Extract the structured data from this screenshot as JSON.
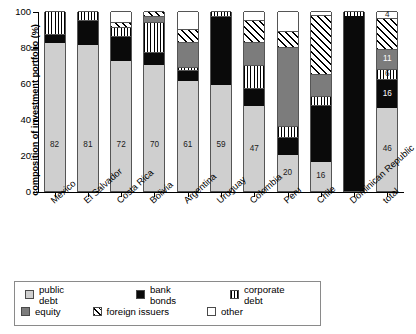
{
  "chart_data": {
    "type": "bar",
    "title": "",
    "subtitle": "",
    "stacked": true,
    "xlabel": "",
    "ylabel": "composition of investment portfolio (%)",
    "ylim": [
      0,
      100
    ],
    "yticks": [
      0,
      20,
      40,
      60,
      80,
      100
    ],
    "ytick_labels": [
      "0",
      "20",
      "40",
      "60",
      "80",
      "100"
    ],
    "grid": false,
    "legend_position": "bottom",
    "categories": [
      "Mexico",
      "El Salvador",
      "Costa Rica",
      "Bolivia",
      "Argentina",
      "Uruguay",
      "Colombia",
      "Peru",
      "Chile",
      "Dominican Republic",
      "total"
    ],
    "series": [
      {
        "name": "public debt",
        "color": "#cfcfcf",
        "pattern": "solid",
        "values": [
          82,
          81,
          72,
          70,
          61,
          59,
          47,
          20,
          16,
          0,
          46
        ]
      },
      {
        "name": "bank bonds",
        "color": "#0a0a0a",
        "pattern": "solid",
        "values": [
          5,
          14,
          14,
          7,
          6,
          38,
          10,
          10,
          32,
          97,
          16
        ]
      },
      {
        "name": "corporate debt",
        "color": "#ffffff",
        "pattern": "vertical-stripes",
        "values": [
          13,
          5,
          5,
          17,
          2,
          3,
          13,
          6,
          5,
          3,
          6
        ]
      },
      {
        "name": "equity",
        "color": "#7c7c7c",
        "pattern": "solid",
        "values": [
          0,
          0,
          0,
          3,
          14,
          0,
          13,
          44,
          12,
          0,
          11
        ]
      },
      {
        "name": "foreign issuers",
        "color": "#ffffff",
        "pattern": "diagonal-hatch",
        "values": [
          0,
          0,
          3,
          3,
          7,
          0,
          12,
          9,
          33,
          0,
          17
        ]
      },
      {
        "name": "other",
        "color": "#ffffff",
        "pattern": "solid",
        "values": [
          0,
          0,
          6,
          0,
          10,
          0,
          5,
          11,
          2,
          0,
          4
        ]
      }
    ],
    "data_labels": {
      "public debt": [
        "82",
        "81",
        "72",
        "70",
        "61",
        "59",
        "47",
        "20",
        "16",
        "",
        "46"
      ],
      "bank bonds": [
        "",
        "",
        "",
        "",
        "",
        "",
        "",
        "",
        "",
        "",
        "16"
      ],
      "corporate debt": [
        "",
        "",
        "",
        "",
        "",
        "",
        "",
        "",
        "",
        "",
        "6"
      ],
      "equity": [
        "",
        "",
        "",
        "",
        "",
        "",
        "",
        "",
        "",
        "",
        "11"
      ],
      "foreign issuers": [
        "",
        "",
        "",
        "",
        "",
        "",
        "",
        "",
        "",
        "",
        ""
      ],
      "other": [
        "",
        "",
        "",
        "",
        "",
        "",
        "",
        "",
        "",
        "",
        "4"
      ]
    }
  },
  "legend": {
    "items": [
      {
        "label": "public debt",
        "swatch": "public"
      },
      {
        "label": "bank bonds",
        "swatch": "bank"
      },
      {
        "label": "corporate debt",
        "swatch": "corporate"
      },
      {
        "label": "equity",
        "swatch": "equity"
      },
      {
        "label": "foreign issuers",
        "swatch": "foreign"
      },
      {
        "label": "other",
        "swatch": "other"
      }
    ]
  }
}
